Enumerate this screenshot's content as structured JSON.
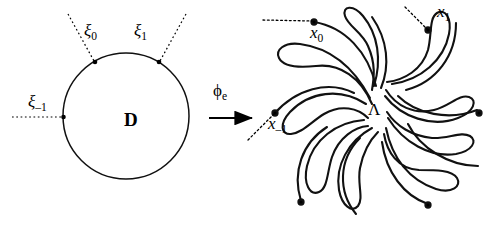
{
  "figure": {
    "background_color": "#ffffff",
    "stroke_color": "#000000",
    "width": 501,
    "height": 226
  },
  "left_panel": {
    "region_label": "D",
    "boundary_points": [
      {
        "id": "xi-minus-1",
        "label_base": "ξ",
        "label_sub": "–1",
        "position": "left"
      },
      {
        "id": "xi-0",
        "label_base": "ξ",
        "label_sub": "0",
        "position": "upper-left"
      },
      {
        "id": "xi-1",
        "label_base": "ξ",
        "label_sub": "1",
        "position": "upper-right"
      }
    ]
  },
  "map_arrow": {
    "label_base": "ϕ",
    "label_sub": "e"
  },
  "right_panel": {
    "region_label": "Λ",
    "endpoints": [
      {
        "id": "x-minus-1",
        "label_base": "x",
        "label_sub": "–1",
        "position": "left"
      },
      {
        "id": "x-0",
        "label_base": "x",
        "label_sub": "0",
        "position": "upper-left"
      },
      {
        "id": "x-1",
        "label_base": "x",
        "label_sub": "1",
        "position": "upper-right"
      }
    ],
    "arm_count": 9
  }
}
